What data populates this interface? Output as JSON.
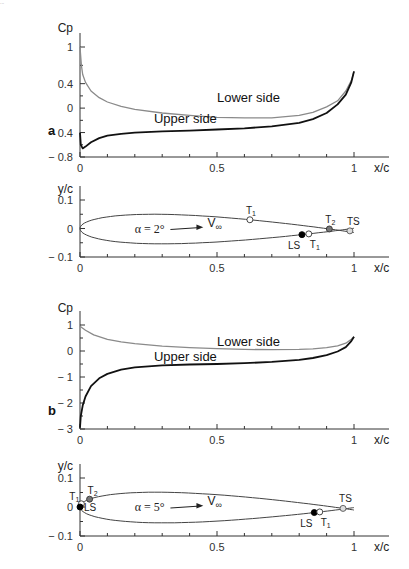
{
  "header_text": "...",
  "colors": {
    "upper": "#111111",
    "lower": "#8a8a8a",
    "axis": "#333333",
    "marker_open": "#ffffff",
    "marker_filled": "#000000",
    "marker_gray": "#777777"
  },
  "chart_data": [
    {
      "panel": "a",
      "type": "line",
      "title": "",
      "xlabel": "x/c",
      "ylabel": "Cp",
      "xlim": [
        0,
        1
      ],
      "ylim": [
        -0.8,
        1.0
      ],
      "xticks": [
        0,
        0.5,
        1
      ],
      "yticks": [
        1,
        0.4,
        0,
        -0.4,
        -0.8
      ],
      "ytick_labels": [
        "1",
        "0.4",
        "0",
        "− 0.4",
        "− 0.8"
      ],
      "series": [
        {
          "name": "Lower side",
          "x": [
            0,
            0.005,
            0.01,
            0.02,
            0.04,
            0.07,
            0.1,
            0.15,
            0.2,
            0.3,
            0.4,
            0.5,
            0.6,
            0.7,
            0.8,
            0.85,
            0.9,
            0.94,
            0.97,
            0.99,
            1.0
          ],
          "y": [
            1.0,
            0.7,
            0.55,
            0.42,
            0.28,
            0.17,
            0.1,
            0.03,
            -0.02,
            -0.08,
            -0.12,
            -0.15,
            -0.16,
            -0.16,
            -0.12,
            -0.07,
            0.02,
            0.12,
            0.28,
            0.45,
            0.6
          ]
        },
        {
          "name": "Upper side",
          "x": [
            0,
            0.003,
            0.01,
            0.02,
            0.04,
            0.07,
            0.1,
            0.15,
            0.2,
            0.3,
            0.4,
            0.5,
            0.6,
            0.7,
            0.8,
            0.85,
            0.9,
            0.94,
            0.97,
            0.99,
            1.0
          ],
          "y": [
            -0.4,
            -0.6,
            -0.66,
            -0.63,
            -0.56,
            -0.49,
            -0.45,
            -0.42,
            -0.4,
            -0.38,
            -0.37,
            -0.35,
            -0.33,
            -0.3,
            -0.24,
            -0.18,
            -0.08,
            0.06,
            0.22,
            0.42,
            0.6
          ]
        }
      ],
      "annotations": [
        {
          "text": "Lower side",
          "x": 0.5,
          "y": 0.1
        },
        {
          "text": "Upper side",
          "x": 0.27,
          "y": -0.25
        }
      ]
    },
    {
      "panel": "a",
      "type": "line",
      "xlabel": "x/c",
      "ylabel": "y/c",
      "xlim": [
        0,
        1
      ],
      "ylim": [
        -0.1,
        0.1
      ],
      "xticks": [
        0,
        0.5,
        1
      ],
      "yticks": [
        0.1,
        0,
        -0.1
      ],
      "ytick_labels": [
        "0.1",
        "0",
        "− 0.1"
      ],
      "alpha_text": "α = 2°",
      "freestream_text": "V",
      "freestream_sub": "∞",
      "markers": [
        {
          "label": "T",
          "sub": "1",
          "x": 0.62,
          "surface": "upper",
          "style": "open"
        },
        {
          "label": "T",
          "sub": "2",
          "x": 0.91,
          "surface": "upper",
          "style": "gray"
        },
        {
          "label": "TS",
          "sub": "",
          "x": 0.985,
          "surface": "te",
          "style": "open-gray"
        },
        {
          "label": "LS",
          "sub": "",
          "x": 0.81,
          "surface": "lower",
          "style": "filled"
        },
        {
          "label": "T",
          "sub": "1",
          "x": 0.835,
          "surface": "lower",
          "style": "open"
        }
      ]
    },
    {
      "panel": "b",
      "type": "line",
      "xlabel": "x/c",
      "ylabel": "Cp",
      "xlim": [
        0,
        1
      ],
      "ylim": [
        -3,
        1
      ],
      "xticks": [
        0,
        0.5,
        1
      ],
      "yticks": [
        1,
        0,
        -1,
        -2,
        -3
      ],
      "ytick_labels": [
        "1",
        "0",
        "− 1",
        "− 2",
        "− 3"
      ],
      "series": [
        {
          "name": "Lower side",
          "x": [
            0,
            0.02,
            0.05,
            0.1,
            0.15,
            0.2,
            0.3,
            0.4,
            0.5,
            0.6,
            0.7,
            0.8,
            0.85,
            0.9,
            0.94,
            0.97,
            0.99,
            1.0
          ],
          "y": [
            0.95,
            0.8,
            0.62,
            0.45,
            0.35,
            0.28,
            0.19,
            0.13,
            0.09,
            0.06,
            0.05,
            0.06,
            0.08,
            0.13,
            0.2,
            0.3,
            0.45,
            0.55
          ]
        },
        {
          "name": "Upper side",
          "x": [
            0,
            0.003,
            0.01,
            0.02,
            0.04,
            0.07,
            0.1,
            0.15,
            0.2,
            0.3,
            0.4,
            0.5,
            0.6,
            0.7,
            0.8,
            0.85,
            0.9,
            0.94,
            0.97,
            0.99,
            1.0
          ],
          "y": [
            -2.95,
            -2.5,
            -2.1,
            -1.75,
            -1.35,
            -1.05,
            -0.88,
            -0.72,
            -0.63,
            -0.55,
            -0.52,
            -0.5,
            -0.47,
            -0.42,
            -0.34,
            -0.27,
            -0.16,
            -0.02,
            0.15,
            0.38,
            0.55
          ]
        }
      ],
      "annotations": [
        {
          "text": "Lower side",
          "x": 0.5,
          "y": 0.2
        },
        {
          "text": "Upper side",
          "x": 0.27,
          "y": -0.4
        }
      ]
    },
    {
      "panel": "b",
      "type": "line",
      "xlabel": "x/c",
      "ylabel": "y/c",
      "xlim": [
        0,
        1
      ],
      "ylim": [
        -0.1,
        0.1
      ],
      "xticks": [
        0,
        0.5,
        1
      ],
      "yticks": [
        0.1,
        0,
        -0.1
      ],
      "ytick_labels": [
        "0.1",
        "0",
        "− 0.1"
      ],
      "alpha_text": "α = 5°",
      "freestream_text": "V",
      "freestream_sub": "∞",
      "markers": [
        {
          "label": "T",
          "sub": "1",
          "x": 0.005,
          "surface": "upper",
          "style": "open"
        },
        {
          "label": "T",
          "sub": "2",
          "x": 0.035,
          "surface": "upper",
          "style": "gray"
        },
        {
          "label": "LS",
          "sub": "",
          "x": 0.0,
          "surface": "le",
          "style": "filled"
        },
        {
          "label": "TS",
          "sub": "",
          "x": 0.96,
          "surface": "upper",
          "style": "open-gray"
        },
        {
          "label": "LS",
          "sub": "",
          "x": 0.855,
          "surface": "lower",
          "style": "filled"
        },
        {
          "label": "T",
          "sub": "1",
          "x": 0.875,
          "surface": "lower",
          "style": "open"
        }
      ]
    }
  ],
  "panels": {
    "a_label": "a",
    "b_label": "b"
  }
}
